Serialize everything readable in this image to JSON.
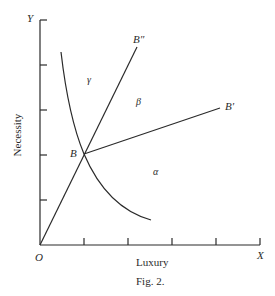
{
  "figure": {
    "caption": "Fig. 2.",
    "axes": {
      "x_label": "Luxury",
      "y_label": "Necessity",
      "x_end": "X",
      "y_end": "Y",
      "origin": "O",
      "x_ticks": 3,
      "y_ticks": 4
    },
    "points": {
      "B": "B",
      "B_prime": "B′",
      "B_double_prime": "B″"
    },
    "regions": {
      "alpha": "α",
      "beta": "β",
      "gamma": "γ"
    },
    "lines": [
      {
        "name": "OB-B-double-prime",
        "from": "O",
        "through": "B",
        "to": "B″"
      },
      {
        "name": "B-B-prime",
        "from": "B",
        "to": "B′"
      }
    ],
    "curve": {
      "name": "indifference-curve",
      "through": "B",
      "shape": "convex decreasing"
    },
    "stroke_color": "#2a2a2a"
  }
}
